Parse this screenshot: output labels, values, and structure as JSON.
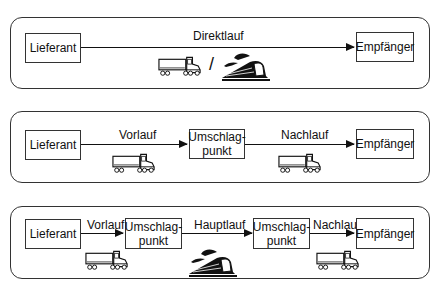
{
  "diagram": {
    "type": "transport-chain",
    "panels": [
      {
        "name": "direktlauf",
        "nodes": [
          "Lieferant",
          "Empfänger"
        ],
        "edges": [
          {
            "label": "Direktlauf",
            "mode_icons": [
              "truck-icon",
              "train-icon"
            ],
            "separator": "/"
          }
        ]
      },
      {
        "name": "gebrochen-einfach",
        "nodes": [
          "Lieferant",
          "Umschlag-\npunkt",
          "Empfänger"
        ],
        "edges": [
          {
            "label": "Vorlauf",
            "mode_icons": [
              "truck-icon"
            ]
          },
          {
            "label": "Nachlauf",
            "mode_icons": [
              "truck-icon"
            ]
          }
        ]
      },
      {
        "name": "gebrochen-mehrfach",
        "nodes": [
          "Lieferant",
          "Umschlag-\npunkt",
          "Umschlag-\npunkt",
          "Empfänger"
        ],
        "edges": [
          {
            "label": "Vorlauf",
            "mode_icons": [
              "truck-icon"
            ]
          },
          {
            "label": "Hauptlauf",
            "mode_icons": [
              "train-icon"
            ]
          },
          {
            "label": "Nachlauf",
            "mode_icons": [
              "truck-icon"
            ]
          }
        ]
      }
    ]
  },
  "p1": {
    "n1": "Lieferant",
    "n2": "Empfänger",
    "e1": "Direktlauf",
    "sep": "/"
  },
  "p2": {
    "n1": "Lieferant",
    "n2a": "Umschlag-",
    "n2b": "punkt",
    "n3": "Empfänger",
    "e1": "Vorlauf",
    "e2": "Nachlauf"
  },
  "p3": {
    "n1": "Lieferant",
    "n2a": "Umschlag-",
    "n2b": "punkt",
    "n3a": "Umschlag-",
    "n3b": "punkt",
    "n4": "Empfänger",
    "e1": "Vorlauf",
    "e2": "Hauptlauf",
    "e3": "Nachlauf"
  }
}
